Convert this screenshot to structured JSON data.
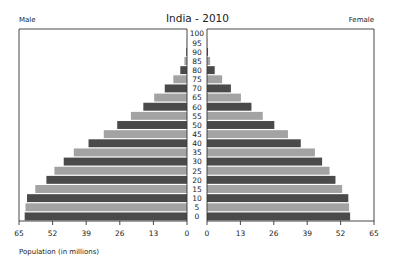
{
  "chart": {
    "title": "India - 2010",
    "left_label": "Male",
    "right_label": "Female",
    "xlabel": "Population (in millions)"
  },
  "colors": {
    "dark": "#4a4a4a",
    "light": "#a3a3a3",
    "axis": "#333333"
  },
  "chart_data": {
    "type": "bar",
    "subtype": "population-pyramid",
    "title": "India - 2010",
    "xlabel": "Population (in millions)",
    "ylabel": "Age",
    "categories": [
      "0",
      "5",
      "10",
      "15",
      "20",
      "25",
      "30",
      "35",
      "40",
      "45",
      "50",
      "55",
      "60",
      "65",
      "70",
      "75",
      "80",
      "85",
      "90",
      "95",
      "100"
    ],
    "series": [
      {
        "name": "Male",
        "values": [
          62.8,
          62.5,
          61.9,
          58.7,
          54.4,
          51.3,
          47.7,
          43.8,
          38.1,
          32.2,
          27.0,
          21.7,
          16.9,
          12.7,
          8.6,
          5.3,
          2.6,
          1.0,
          0.3,
          0.1,
          0.0
        ]
      },
      {
        "name": "Female",
        "values": [
          55.7,
          55.3,
          55.0,
          52.6,
          50.0,
          47.7,
          44.8,
          42.0,
          36.5,
          31.5,
          26.2,
          21.7,
          17.3,
          13.2,
          9.3,
          5.9,
          3.0,
          1.2,
          0.4,
          0.1,
          0.0
        ]
      }
    ],
    "xticks_left": [
      65,
      52,
      39,
      26,
      13,
      0
    ],
    "xticks_right": [
      0,
      13,
      26,
      39,
      52,
      65
    ],
    "xlim": [
      0,
      65
    ],
    "legend": [
      "Male",
      "Female"
    ],
    "grid": false
  }
}
